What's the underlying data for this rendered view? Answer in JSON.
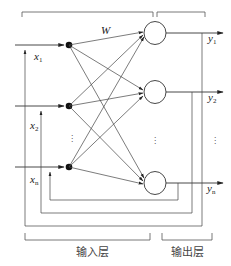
{
  "diagram": {
    "type": "recurrent neural network (Hopfield-style) structure",
    "weight_label": "W",
    "inputs": [
      {
        "name": "x",
        "sub": "1"
      },
      {
        "name": "x",
        "sub": "2"
      },
      {
        "name": "x",
        "sub": "n"
      }
    ],
    "outputs": [
      {
        "name": "y",
        "sub": "1"
      },
      {
        "name": "y",
        "sub": "2"
      },
      {
        "name": "y",
        "sub": "n"
      }
    ],
    "ellipsis": "⋮",
    "layers": {
      "input_label": "输入层",
      "output_label": "输出层"
    },
    "colors": {
      "line": "#333333",
      "node": "#111111",
      "background": "#ffffff"
    }
  }
}
